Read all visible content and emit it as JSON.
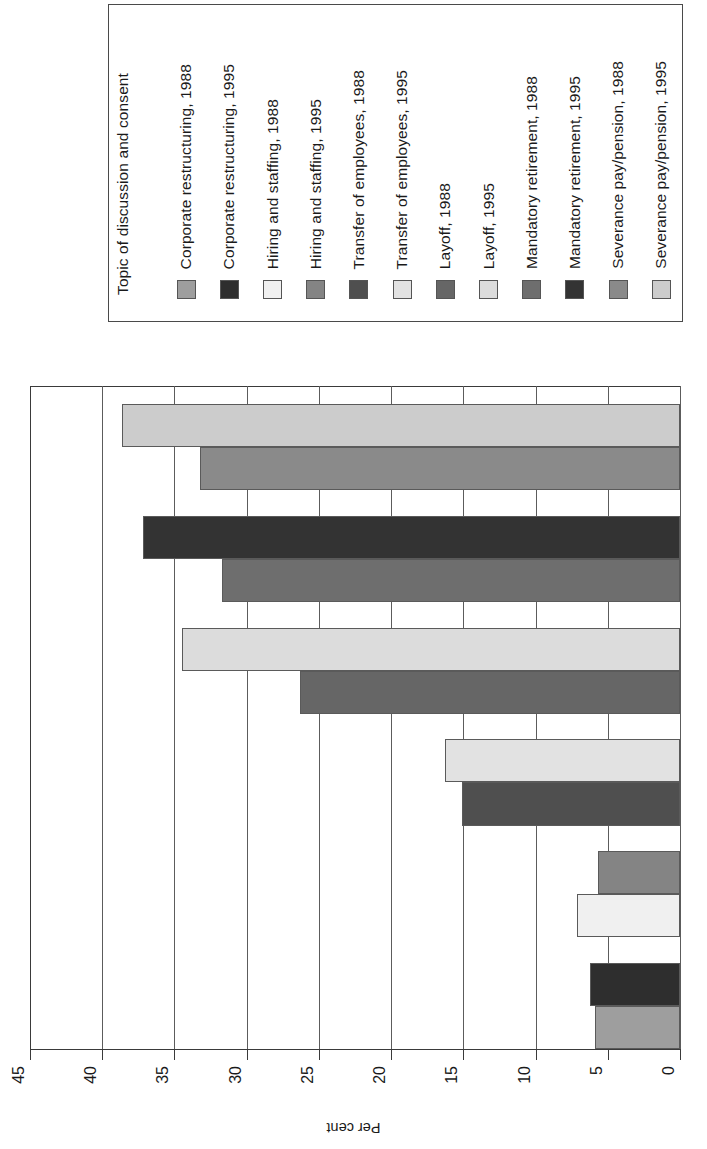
{
  "legend": {
    "title": "Topic of discussion and consent",
    "entries": [
      {
        "label": "Corporate restructuring, 1988",
        "color": "#9e9e9e"
      },
      {
        "label": "Corporate restructuring, 1995",
        "color": "#2e2e2e"
      },
      {
        "label": "Hiring and staffing, 1988",
        "color": "#f0f0f0"
      },
      {
        "label": "Hiring and staffing, 1995",
        "color": "#848484"
      },
      {
        "label": "Transfer of employees, 1988",
        "color": "#4f4f4f"
      },
      {
        "label": "Transfer of employees, 1995",
        "color": "#e2e2e2"
      },
      {
        "label": "Layoff, 1988",
        "color": "#666666"
      },
      {
        "label": "Layoff, 1995",
        "color": "#dcdcdc"
      },
      {
        "label": "Mandatory retirement, 1988",
        "color": "#6e6e6e"
      },
      {
        "label": "Mandatory retirement, 1995",
        "color": "#333333"
      },
      {
        "label": "Severance pay/pension, 1988",
        "color": "#8a8a8a"
      },
      {
        "label": "Severance pay/pension, 1995",
        "color": "#cccccc"
      }
    ]
  },
  "chart_data": {
    "type": "bar",
    "orientation": "horizontal",
    "title": "",
    "xlabel": "Per cent",
    "ylabel": "",
    "xlim": [
      0,
      45
    ],
    "xticks": [
      0,
      5,
      10,
      15,
      20,
      25,
      30,
      35,
      40,
      45
    ],
    "xtick_labels": [
      "0",
      "5",
      "10",
      "15",
      "20",
      "25",
      "30",
      "35",
      "40",
      "45"
    ],
    "grid": true,
    "legend_position": "top",
    "legend_title": "Topic of discussion and consent",
    "categories": [
      "Corporate restructuring",
      "Hiring and staffing",
      "Transfer of employees",
      "Layoff",
      "Mandatory retirement",
      "Severance pay/pension"
    ],
    "series": [
      {
        "name": "1988",
        "values": [
          5.9,
          7.1,
          15.1,
          26.3,
          31.7,
          33.2
        ]
      },
      {
        "name": "1995",
        "values": [
          6.2,
          5.7,
          16.3,
          34.5,
          37.2,
          38.6
        ]
      }
    ],
    "bars": [
      {
        "label": "Severance pay/pension, 1995",
        "value": 38.6,
        "color": "#cccccc"
      },
      {
        "label": "Severance pay/pension, 1988",
        "value": 33.2,
        "color": "#8a8a8a"
      },
      {
        "label": "Mandatory retirement, 1995",
        "value": 37.2,
        "color": "#333333"
      },
      {
        "label": "Mandatory retirement, 1988",
        "value": 31.7,
        "color": "#6e6e6e"
      },
      {
        "label": "Layoff, 1995",
        "value": 34.5,
        "color": "#dcdcdc"
      },
      {
        "label": "Layoff, 1988",
        "value": 26.3,
        "color": "#666666"
      },
      {
        "label": "Transfer of employees, 1995",
        "value": 16.3,
        "color": "#e2e2e2"
      },
      {
        "label": "Transfer of employees, 1988",
        "value": 15.1,
        "color": "#4f4f4f"
      },
      {
        "label": "Hiring and staffing, 1995",
        "value": 5.7,
        "color": "#848484"
      },
      {
        "label": "Hiring and staffing, 1988",
        "value": 7.1,
        "color": "#f0f0f0"
      },
      {
        "label": "Corporate restructuring, 1995",
        "value": 6.2,
        "color": "#2e2e2e"
      },
      {
        "label": "Corporate restructuring, 1988",
        "value": 5.9,
        "color": "#9e9e9e"
      }
    ]
  }
}
